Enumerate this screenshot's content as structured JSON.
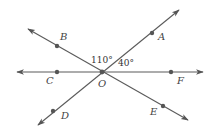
{
  "diagram": {
    "type": "intersecting-lines",
    "center": {
      "name": "O",
      "x": 102,
      "y": 72
    },
    "lines": [
      {
        "name": "line-CF",
        "from": [
          17,
          72
        ],
        "to": [
          203,
          72
        ],
        "arrows": "both"
      },
      {
        "name": "line-BE",
        "from": [
          28,
          29
        ],
        "to": [
          188,
          120
        ],
        "arrows": "both"
      },
      {
        "name": "line-DA",
        "from": [
          38,
          125
        ],
        "to": [
          179,
          10
        ],
        "arrows": "both"
      }
    ],
    "points": [
      {
        "name": "A",
        "x": 152,
        "y": 33,
        "label": "A",
        "lx": 158,
        "ly": 40
      },
      {
        "name": "B",
        "x": 57,
        "y": 46,
        "label": "B",
        "lx": 60,
        "ly": 40
      },
      {
        "name": "C",
        "x": 57,
        "y": 72,
        "label": "C",
        "lx": 46,
        "ly": 84
      },
      {
        "name": "D",
        "x": 53,
        "y": 111,
        "label": "D",
        "lx": 61,
        "ly": 119
      },
      {
        "name": "E",
        "x": 163,
        "y": 106,
        "label": "E",
        "lx": 150,
        "ly": 115
      },
      {
        "name": "F",
        "x": 171,
        "y": 72,
        "label": "F",
        "lx": 177,
        "ly": 84
      },
      {
        "name": "O",
        "x": 102,
        "y": 72,
        "label": "O",
        "lx": 98,
        "ly": 87
      }
    ],
    "angles": [
      {
        "name": "angle-BOA",
        "label": "110°",
        "x": 91,
        "y": 63
      },
      {
        "name": "angle-AOF",
        "label": "40°",
        "x": 118,
        "y": 66
      }
    ],
    "colors": {
      "line": "#5a5a5a",
      "dot": "#555555",
      "text": "#444444"
    }
  }
}
